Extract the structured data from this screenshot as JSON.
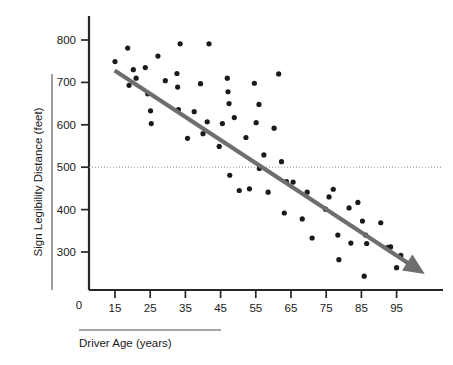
{
  "chart_data": {
    "type": "scatter",
    "title": "",
    "xlabel": "Driver Age (years)",
    "ylabel": "Sign Legibility Distance (feet)",
    "xlim": [
      10,
      104
    ],
    "ylim": [
      0,
      840
    ],
    "xticks": [
      "15",
      "25",
      "35",
      "45",
      "55",
      "65",
      "75",
      "85",
      "95"
    ],
    "xtick_values": [
      15,
      25,
      35,
      45,
      55,
      65,
      75,
      85,
      95
    ],
    "yticks": [
      "300",
      "400",
      "500",
      "600",
      "700",
      "800"
    ],
    "ytick_values": [
      300,
      400,
      500,
      600,
      700,
      800
    ],
    "origin_label": "0",
    "grid": false,
    "legend": null,
    "reference_line": {
      "orientation": "horizontal",
      "value": 500,
      "style": "dotted",
      "color": "#8c8c8c"
    },
    "trend_line": {
      "style": "solid-arrow",
      "color": "#6e6e6e",
      "x_start": 14.9,
      "y_start": 728,
      "x_end": 103.0,
      "y_end": 248,
      "direction": "negative",
      "annotation": "downward trend arrow"
    },
    "point_color": "#1a1a1a",
    "point_radius_px": 2.6,
    "points": [
      {
        "x": 15.0,
        "y": 749
      },
      {
        "x": 18.6,
        "y": 781
      },
      {
        "x": 19.0,
        "y": 693
      },
      {
        "x": 20.2,
        "y": 730
      },
      {
        "x": 21.0,
        "y": 710
      },
      {
        "x": 23.6,
        "y": 735
      },
      {
        "x": 24.3,
        "y": 673
      },
      {
        "x": 25.1,
        "y": 633
      },
      {
        "x": 25.3,
        "y": 603
      },
      {
        "x": 27.2,
        "y": 762
      },
      {
        "x": 29.3,
        "y": 704
      },
      {
        "x": 32.6,
        "y": 721
      },
      {
        "x": 32.8,
        "y": 689
      },
      {
        "x": 33.0,
        "y": 636
      },
      {
        "x": 33.5,
        "y": 791
      },
      {
        "x": 35.6,
        "y": 568
      },
      {
        "x": 37.5,
        "y": 631
      },
      {
        "x": 39.3,
        "y": 697
      },
      {
        "x": 40.0,
        "y": 579
      },
      {
        "x": 41.2,
        "y": 607
      },
      {
        "x": 41.7,
        "y": 791
      },
      {
        "x": 44.6,
        "y": 549
      },
      {
        "x": 45.5,
        "y": 603
      },
      {
        "x": 46.9,
        "y": 710
      },
      {
        "x": 47.1,
        "y": 678
      },
      {
        "x": 47.4,
        "y": 650
      },
      {
        "x": 47.6,
        "y": 481
      },
      {
        "x": 48.9,
        "y": 617
      },
      {
        "x": 50.3,
        "y": 445
      },
      {
        "x": 52.2,
        "y": 570
      },
      {
        "x": 53.2,
        "y": 449
      },
      {
        "x": 54.6,
        "y": 698
      },
      {
        "x": 55.1,
        "y": 605
      },
      {
        "x": 55.9,
        "y": 648
      },
      {
        "x": 56.0,
        "y": 497
      },
      {
        "x": 57.3,
        "y": 529
      },
      {
        "x": 58.5,
        "y": 441
      },
      {
        "x": 60.2,
        "y": 592
      },
      {
        "x": 61.5,
        "y": 720
      },
      {
        "x": 62.3,
        "y": 513
      },
      {
        "x": 63.1,
        "y": 392
      },
      {
        "x": 63.7,
        "y": 466
      },
      {
        "x": 65.6,
        "y": 465
      },
      {
        "x": 68.2,
        "y": 378
      },
      {
        "x": 69.6,
        "y": 441
      },
      {
        "x": 71.0,
        "y": 333
      },
      {
        "x": 74.8,
        "y": 401
      },
      {
        "x": 75.8,
        "y": 430
      },
      {
        "x": 77.0,
        "y": 448
      },
      {
        "x": 78.3,
        "y": 340
      },
      {
        "x": 78.6,
        "y": 282
      },
      {
        "x": 81.5,
        "y": 404
      },
      {
        "x": 82.0,
        "y": 321
      },
      {
        "x": 84.0,
        "y": 417
      },
      {
        "x": 85.3,
        "y": 373
      },
      {
        "x": 85.8,
        "y": 243
      },
      {
        "x": 86.2,
        "y": 340
      },
      {
        "x": 86.5,
        "y": 320
      },
      {
        "x": 90.5,
        "y": 369
      },
      {
        "x": 92.5,
        "y": 311
      },
      {
        "x": 93.3,
        "y": 312
      },
      {
        "x": 95.0,
        "y": 263
      },
      {
        "x": 96.2,
        "y": 292
      }
    ]
  },
  "axes": {
    "y_axis_title": "Sign Legibility Distance (feet)",
    "x_axis_title": "Driver Age (years)",
    "origin": "0"
  }
}
